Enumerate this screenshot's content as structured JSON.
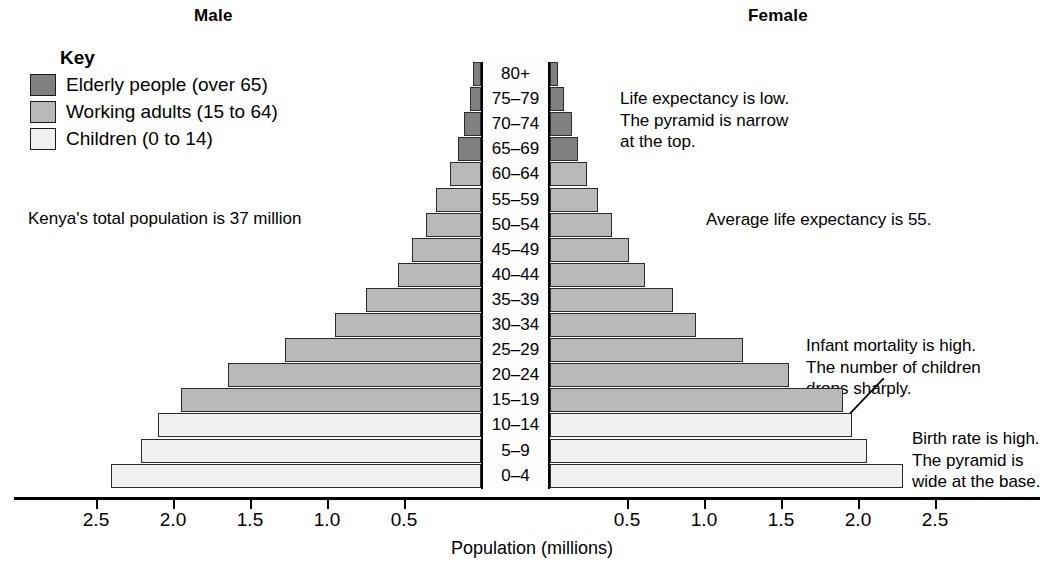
{
  "headings": {
    "male": "Male",
    "female": "Female"
  },
  "key": {
    "title": "Key",
    "items": [
      {
        "label": "Elderly people (over 65)",
        "color": "#808080",
        "swatch_name": "elderly"
      },
      {
        "label": "Working adults (15 to 64)",
        "color": "#b9b9b9",
        "swatch_name": "working"
      },
      {
        "label": "Children (0 to 14)",
        "color": "#f1f1f1",
        "swatch_name": "children"
      }
    ]
  },
  "notes": {
    "total_population": "Kenya's total population is 37 million",
    "life_expectancy_top": "Life expectancy is low.\nThe pyramid is narrow\nat the top.",
    "life_expectancy_avg": "Average life expectancy is 55.",
    "infant_mortality": "Infant mortality is high.\nThe number of children\ndrops sharply.",
    "birth_rate": "Birth rate is high.\nThe pyramid is\nwide at the base."
  },
  "chart_data": {
    "type": "bar",
    "subtype": "population-pyramid",
    "title": "",
    "xlabel": "Population (millions)",
    "ylabel": "",
    "grid": false,
    "legend_position": "top-left",
    "axis_ticks": [
      "2.5",
      "2.0",
      "1.5",
      "1.0",
      "0.5",
      "0.5",
      "1.0",
      "1.5",
      "2.0",
      "2.5"
    ],
    "xlim": [
      0,
      2.5
    ],
    "categories": [
      "80+",
      "75–79",
      "70–74",
      "65–69",
      "60–64",
      "55–59",
      "50–54",
      "45–49",
      "40–44",
      "35–39",
      "30–34",
      "25–29",
      "20–24",
      "15–19",
      "10–14",
      "5–9",
      "0–4"
    ],
    "group_of_category": [
      "elderly",
      "elderly",
      "elderly",
      "elderly",
      "working",
      "working",
      "working",
      "working",
      "working",
      "working",
      "working",
      "working",
      "working",
      "working",
      "children",
      "children",
      "children"
    ],
    "series": [
      {
        "name": "Male",
        "side": "left",
        "values": [
          0.05,
          0.07,
          0.11,
          0.15,
          0.2,
          0.29,
          0.36,
          0.45,
          0.54,
          0.75,
          0.95,
          1.27,
          1.64,
          1.95,
          2.1,
          2.21,
          2.4
        ]
      },
      {
        "name": "Female",
        "side": "right",
        "values": [
          0.05,
          0.09,
          0.14,
          0.18,
          0.24,
          0.31,
          0.4,
          0.51,
          0.62,
          0.8,
          0.95,
          1.25,
          1.55,
          1.9,
          1.96,
          2.06,
          2.29
        ]
      }
    ],
    "colors": {
      "elderly": "#808080",
      "working": "#b9b9b9",
      "children": "#f1f1f1",
      "outline": "#2b2b2b",
      "axis": "#000000"
    }
  }
}
